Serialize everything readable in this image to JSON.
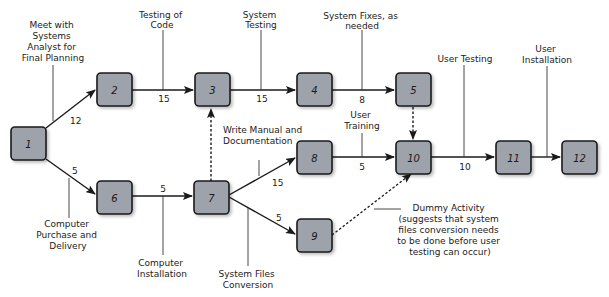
{
  "diagram": {
    "type": "PERT network",
    "colors": {
      "node_fill": "#9ea2aa",
      "node_border": "#1a1a1a",
      "line": "#1a1a1a",
      "shadow": "#c8c8c8"
    },
    "nodes": [
      {
        "id": "1",
        "label": "1",
        "x": 11,
        "y": 127
      },
      {
        "id": "2",
        "label": "2",
        "x": 97,
        "y": 73
      },
      {
        "id": "3",
        "label": "3",
        "x": 195,
        "y": 73
      },
      {
        "id": "4",
        "label": "4",
        "x": 297,
        "y": 73
      },
      {
        "id": "5",
        "label": "5",
        "x": 396,
        "y": 73
      },
      {
        "id": "6",
        "label": "6",
        "x": 97,
        "y": 181
      },
      {
        "id": "7",
        "label": "7",
        "x": 194,
        "y": 181
      },
      {
        "id": "8",
        "label": "8",
        "x": 297,
        "y": 141
      },
      {
        "id": "9",
        "label": "9",
        "x": 297,
        "y": 219
      },
      {
        "id": "10",
        "label": "10",
        "x": 396,
        "y": 141
      },
      {
        "id": "11",
        "label": "11",
        "x": 496,
        "y": 141
      },
      {
        "id": "12",
        "label": "12",
        "x": 562,
        "y": 141
      }
    ],
    "edges": [
      {
        "from": "1",
        "to": "2",
        "weight": "12",
        "activity": "Meet with Systems Analyst for Final Planning",
        "dummy": false
      },
      {
        "from": "2",
        "to": "3",
        "weight": "15",
        "activity": "Testing of Code",
        "dummy": false
      },
      {
        "from": "3",
        "to": "4",
        "weight": "15",
        "activity": "System Testing",
        "dummy": false
      },
      {
        "from": "4",
        "to": "5",
        "weight": "8",
        "activity": "System Fixes, as needed",
        "dummy": false
      },
      {
        "from": "5",
        "to": "10",
        "weight": "",
        "activity": "",
        "dummy": true
      },
      {
        "from": "1",
        "to": "6",
        "weight": "5",
        "activity": "Computer Purchase and Delivery",
        "dummy": false
      },
      {
        "from": "6",
        "to": "7",
        "weight": "5",
        "activity": "Computer Installation",
        "dummy": false
      },
      {
        "from": "7",
        "to": "3",
        "weight": "",
        "activity": "",
        "dummy": true
      },
      {
        "from": "7",
        "to": "8",
        "weight": "15",
        "activity": "Write Manual and Documentation",
        "dummy": false
      },
      {
        "from": "7",
        "to": "9",
        "weight": "5",
        "activity": "System Files Conversion",
        "dummy": false
      },
      {
        "from": "8",
        "to": "10",
        "weight": "5",
        "activity": "User Training",
        "dummy": false
      },
      {
        "from": "9",
        "to": "10",
        "weight": "",
        "activity": "Dummy Activity",
        "dummy": true
      },
      {
        "from": "10",
        "to": "11",
        "weight": "10",
        "activity": "User Testing",
        "dummy": false
      },
      {
        "from": "11",
        "to": "12",
        "weight": "",
        "activity": "User Installation",
        "dummy": false
      }
    ],
    "annotations": {
      "meet_planning": [
        "Meet with",
        "Systems",
        "Analyst for",
        "Final Planning"
      ],
      "testing_code": [
        "Testing of",
        "Code"
      ],
      "system_testing": [
        "System",
        "Testing"
      ],
      "system_fixes": [
        "System Fixes, as",
        "needed"
      ],
      "user_training": [
        "User",
        "Training"
      ],
      "user_testing": [
        "User Testing"
      ],
      "user_installation": [
        "User",
        "Installation"
      ],
      "write_manual": [
        "Write Manual and",
        "Documentation"
      ],
      "computer_purchase": [
        "Computer",
        "Purchase and",
        "Delivery"
      ],
      "computer_installation": [
        "Computer",
        "Installation"
      ],
      "system_files": [
        "System Files",
        "Conversion"
      ],
      "dummy_activity": [
        "Dummy Activity",
        "(suggests that system",
        "files conversion needs",
        "to be done before user",
        "testing can occur)"
      ]
    },
    "weights": {
      "w_1_2": "12",
      "w_2_3": "15",
      "w_3_4": "15",
      "w_4_5": "8",
      "w_1_6": "5",
      "w_6_7": "5",
      "w_7_8": "15",
      "w_7_9": "5",
      "w_8_10": "5",
      "w_10_11": "10"
    }
  }
}
